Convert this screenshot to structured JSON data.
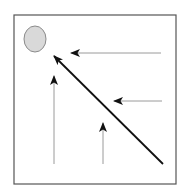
{
  "diagram": {
    "title": "",
    "colors": {
      "background": "#ffffff",
      "frame": "#555555",
      "ellipse_fill": "#d9d9d9",
      "ellipse_stroke": "#8a8a8a",
      "gray_arrow": "#9a9a9a",
      "black_arrow": "#111111",
      "arrowhead": "#111111"
    },
    "frame": {
      "x": 14,
      "y": 15,
      "width": 162,
      "height": 169
    },
    "ellipse": {
      "cx": 35,
      "cy": 39,
      "rx": 11,
      "ry": 13
    },
    "arrows": [
      {
        "id": "top-horizontal",
        "x1": 161,
        "y1": 53,
        "x2": 71,
        "y2": 53,
        "style": "gray"
      },
      {
        "id": "middle-horizontal",
        "x1": 162,
        "y1": 101,
        "x2": 114,
        "y2": 101,
        "style": "gray"
      },
      {
        "id": "diagonal",
        "x1": 163,
        "y1": 164,
        "x2": 54,
        "y2": 56,
        "style": "black"
      },
      {
        "id": "left-vertical",
        "x1": 54,
        "y1": 164,
        "x2": 54,
        "y2": 76,
        "style": "gray"
      },
      {
        "id": "right-vertical",
        "x1": 103,
        "y1": 164,
        "x2": 103,
        "y2": 123,
        "style": "gray"
      }
    ]
  }
}
